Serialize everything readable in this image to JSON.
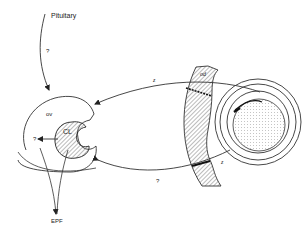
{
  "diagram": {
    "type": "biological-signaling-diagram",
    "nodes": {
      "pituitary": {
        "label": "Pituitary"
      },
      "ovary": {
        "label": "ov"
      },
      "corpus_luteum": {
        "label": "CL"
      },
      "epf": {
        "label": "EPF"
      },
      "oviduct": {
        "label": "od"
      },
      "embryo": {
        "label": ""
      }
    },
    "edge_labels": {
      "pituitary_to_ovary": "?",
      "cl_left": "?",
      "embryo_to_ovary_top": "z",
      "ovary_to_embryo_bottom": "?",
      "oviduct_bottom": "z"
    },
    "colors": {
      "stroke": "#333333",
      "hatch": "#555555",
      "stipple": "#888888",
      "background": "#ffffff"
    }
  }
}
